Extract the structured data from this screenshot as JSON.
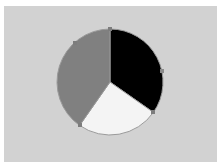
{
  "figure": {
    "background_color": "#ffffff",
    "panel_color": "#d2d2d2",
    "panel_name": "pie-plot-panel"
  },
  "chart_data": {
    "type": "pie",
    "title": "",
    "subtitle": "",
    "xlabel": "",
    "ylabel": "",
    "legend": "none",
    "grid": false,
    "start_angle_deg": 0,
    "direction": "clockwise",
    "center": {
      "cx": 106,
      "cy": 76
    },
    "radius": 53,
    "labels": [
      "Slice 1",
      "Slice 2",
      "Slice 3"
    ],
    "values": [
      34.7,
      25.0,
      40.3
    ],
    "percentages": [
      "34.7%",
      "25.0%",
      "40.3%"
    ],
    "angles_deg": [
      125,
      90,
      145
    ],
    "colors": [
      "#000000",
      "#f4f4f4",
      "#808080"
    ],
    "edge_color": "#9a9a9a",
    "slices": [
      {
        "name": "black-slice",
        "label": "Slice 1",
        "value": 34.7,
        "percentage": "34.7%",
        "color": "#000000",
        "start_deg": 0,
        "end_deg": 125
      },
      {
        "name": "white-slice",
        "label": "Slice 2",
        "value": 25.0,
        "percentage": "25.0%",
        "color": "#f4f4f4",
        "start_deg": 125,
        "end_deg": 215
      },
      {
        "name": "gray-slice",
        "label": "Slice 3",
        "value": 40.3,
        "percentage": "40.3%",
        "color": "#808080",
        "start_deg": 215,
        "end_deg": 360
      }
    ],
    "boundary_markers": [
      {
        "name": "marker-top",
        "angle_deg": 0,
        "color": "#7d7d7d"
      },
      {
        "name": "marker-right",
        "angle_deg": 78,
        "color": "#8a8a8a"
      },
      {
        "name": "marker-bottom-right",
        "angle_deg": 125,
        "color": "#7d7d7d"
      },
      {
        "name": "marker-bottom-left",
        "angle_deg": 215,
        "color": "#7d7d7d"
      },
      {
        "name": "marker-upper-left",
        "angle_deg": 318,
        "color": "#7d7d7d"
      }
    ]
  }
}
